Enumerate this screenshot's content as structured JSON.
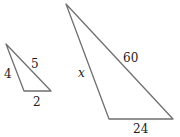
{
  "figure": {
    "small_triangle": {
      "vertices": [
        [
          6,
          44
        ],
        [
          24,
          91
        ],
        [
          51,
          91
        ]
      ],
      "labels": {
        "left_side": "4",
        "hypotenuse": "5",
        "bottom_side": "2"
      }
    },
    "large_triangle": {
      "vertices": [
        [
          66,
          4
        ],
        [
          109,
          119
        ],
        [
          173,
          119
        ]
      ],
      "labels": {
        "left_side": "x",
        "hypotenuse": "60",
        "bottom_side": "24"
      }
    },
    "colors": {
      "stroke": "#6f6f6f",
      "text": "#222222",
      "background": "#ffffff"
    }
  }
}
